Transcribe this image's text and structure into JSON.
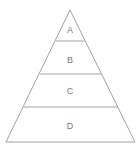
{
  "diagram": {
    "type": "pyramid",
    "stroke_color": "#8a8a8a",
    "label_color": "#777777",
    "levels": [
      {
        "label": "A"
      },
      {
        "label": "B"
      },
      {
        "label": "C"
      },
      {
        "label": "D"
      }
    ]
  }
}
